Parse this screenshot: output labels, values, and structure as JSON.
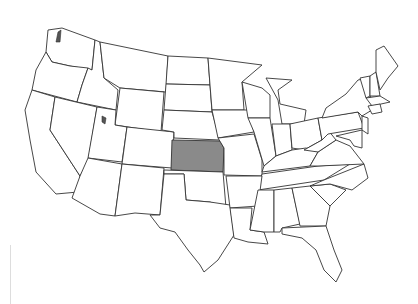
{
  "map": {
    "title": "",
    "region": "Contiguous United States",
    "highlighted_state": "Kansas",
    "highlight_color": "#8a8a8a",
    "border_color": "#333333",
    "background_color": "#ffffff"
  }
}
